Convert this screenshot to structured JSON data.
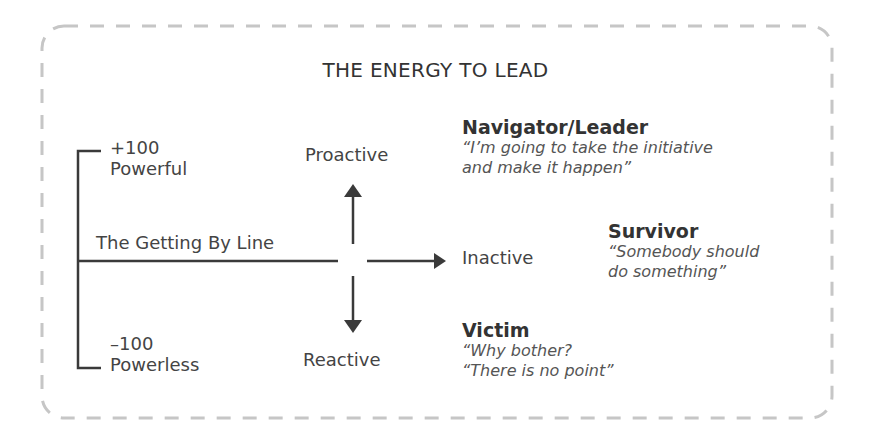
{
  "title": "THE ENERGY TO LEAD",
  "scale": {
    "top_value": "+100",
    "top_label": "Powerful",
    "bottom_value": "–100",
    "bottom_label": "Powerless",
    "midline_label": "The Getting By Line"
  },
  "axes": {
    "up": "Proactive",
    "right": "Inactive",
    "down": "Reactive"
  },
  "states": [
    {
      "name": "Navigator/Leader",
      "quote_line1": "“I’m going to take the initiative",
      "quote_line2": "and make it happen”"
    },
    {
      "name": "Survivor",
      "quote_line1": "“Somebody should",
      "quote_line2": "do something”"
    },
    {
      "name": "Victim",
      "quote_line1": "“Why bother?",
      "quote_line2": "“There is no point”"
    }
  ],
  "colors": {
    "ink": "#3a3a3a",
    "border": "#c8c8c8"
  }
}
